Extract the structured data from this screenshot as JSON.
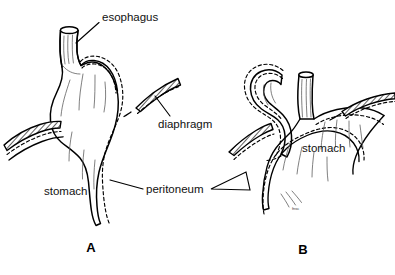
{
  "figure": {
    "background_color": "#ffffff",
    "ink_color": "#000000",
    "style": "black-and-white medical line art"
  },
  "labels": {
    "esophagus": "esophagus",
    "diaphragm": "diaphragm",
    "peritoneum": "peritoneum",
    "stomach_left": "stomach",
    "stomach_right": "stomach",
    "signature": "fnsc"
  },
  "panels": [
    {
      "letter": "A",
      "description": "normal esophagus entering stomach through diaphragmatic hiatus"
    },
    {
      "letter": "B",
      "description": "paraesophageal hiatal hernia with gastric fundus herniating beside esophagus"
    }
  ]
}
